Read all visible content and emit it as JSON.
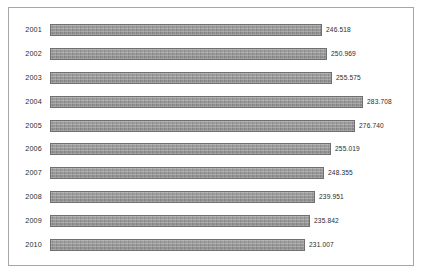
{
  "chart_data": {
    "type": "bar",
    "orientation": "horizontal",
    "title": "",
    "subtitle": "",
    "xlabel": "",
    "ylabel": "",
    "categories": [
      "2001",
      "2002",
      "2003",
      "2004",
      "2005",
      "2006",
      "2007",
      "2008",
      "2009",
      "2010"
    ],
    "values": [
      246.518,
      250.969,
      255.575,
      283.708,
      276.74,
      255.019,
      248.355,
      239.951,
      235.842,
      231.007
    ],
    "value_labels": [
      "246.518",
      "250.969",
      "255.575",
      "283.708",
      "276.740",
      "255.019",
      "248.355",
      "239.951",
      "235.842",
      "231.007"
    ],
    "xlim": [
      0,
      300
    ],
    "grid": false,
    "legend": false,
    "legend_position": "none",
    "data_labels_shown": true,
    "data_label_position": "outside-end",
    "bars": [
      {
        "category": "2001",
        "value": 246.518,
        "label": "246.518"
      },
      {
        "category": "2002",
        "value": 250.969,
        "label": "250.969"
      },
      {
        "category": "2003",
        "value": 255.575,
        "label": "255.575"
      },
      {
        "category": "2004",
        "value": 283.708,
        "label": "283.708"
      },
      {
        "category": "2005",
        "value": 276.74,
        "label": "276.740"
      },
      {
        "category": "2006",
        "value": 255.019,
        "label": "255.019"
      },
      {
        "category": "2007",
        "value": 248.355,
        "label": "248.355"
      },
      {
        "category": "2008",
        "value": 239.951,
        "label": "239.951"
      },
      {
        "category": "2009",
        "value": 235.842,
        "label": "235.842"
      },
      {
        "category": "2010",
        "value": 231.007,
        "label": "231.007"
      }
    ]
  },
  "style": {
    "bar_color": "#9a9a9a",
    "bar_border_color": "#6f6f6f",
    "frame_border_color": "#a6a6a6",
    "background_color": "#ffffff",
    "text_color": "#2b2b2b"
  }
}
